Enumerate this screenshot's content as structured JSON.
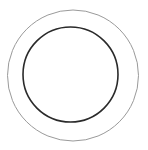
{
  "diagram": {
    "type": "concentric-circles",
    "background": "#ffffff",
    "shapes": [
      {
        "name": "outer-circle",
        "cx": 73,
        "cy": 75.5,
        "r": 65.5,
        "stroke": "#9a9a9a",
        "stroke_width": 1
      },
      {
        "name": "inner-circle",
        "cx": 70.5,
        "cy": 74.5,
        "r": 47.5,
        "stroke": "#2a2a2a",
        "stroke_width": 1.6
      }
    ]
  }
}
